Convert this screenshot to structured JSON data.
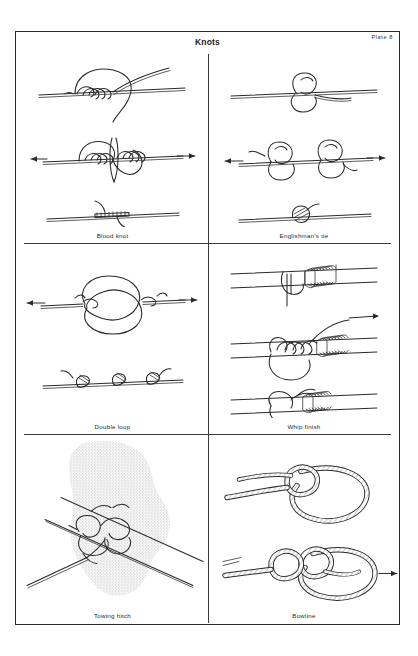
{
  "plate": {
    "title": "Knots",
    "number": "Plate 8"
  },
  "cells": [
    {
      "id": "blood-knot",
      "caption": "Blood knot",
      "row": 1,
      "column": "left",
      "stages": 3,
      "arrows": [
        "left",
        "right"
      ],
      "arrow_stage": 2
    },
    {
      "id": "englishmans-tie",
      "caption": "Englishman's tie",
      "row": 1,
      "column": "right",
      "stages": 3,
      "arrows": [
        "left",
        "right"
      ],
      "arrow_stage": 2
    },
    {
      "id": "double-loop",
      "caption": "Double loop",
      "row": 2,
      "column": "left",
      "stages": 2,
      "arrows": [
        "left",
        "right"
      ],
      "arrow_stage": 1
    },
    {
      "id": "whip-finish",
      "caption": "Whip finish",
      "row": 2,
      "column": "right",
      "stages": 3,
      "arrows": [
        "right"
      ],
      "arrow_stage": 2
    },
    {
      "id": "towing-hitch",
      "caption": "Towing hitch",
      "row": 3,
      "column": "left",
      "stages": 1,
      "arrows": [],
      "arrow_stage": 0
    },
    {
      "id": "bowline",
      "caption": "Bowline",
      "row": 3,
      "column": "right",
      "stages": 2,
      "arrows": [
        "right"
      ],
      "arrow_stage": 2
    }
  ],
  "colors": {
    "ink": "#2a2a2a",
    "border": "#2b2b2b",
    "paper": "#ffffff",
    "stipple": "#d8d8d8"
  }
}
